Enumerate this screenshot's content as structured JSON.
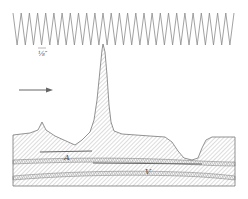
{
  "figure": {
    "scale_label": "⅛″",
    "layer_label_a": "A",
    "layer_label_v": "V",
    "colors": {
      "ink": "#6a6a6a",
      "hatch": "#9a9a9a",
      "background": "#ffffff"
    },
    "waveform": {
      "x_start": 13,
      "x_end": 234,
      "y_top": 13,
      "y_bottom": 45,
      "cycles": 27
    },
    "arrow": {
      "direction": "right"
    }
  }
}
